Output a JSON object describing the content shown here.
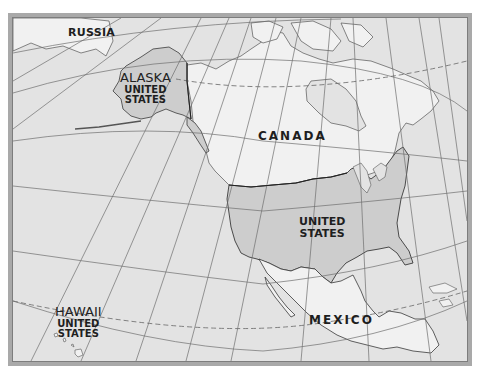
{
  "map": {
    "colors": {
      "frame": "#a9a9a9",
      "ocean": "#e3e3e3",
      "foreign_land": "#f1f1f1",
      "us_land": "#cdcdcd",
      "grid": "#6e6e6e",
      "border": "#3a3a3a"
    },
    "labels": {
      "russia": "RUSSIA",
      "alaska": {
        "name": "ALASKA",
        "country_line1": "UNITED",
        "country_line2": "STATES"
      },
      "canada": "CANADA",
      "united_states": {
        "line1": "UNITED",
        "line2": "STATES"
      },
      "hawaii": {
        "name": "HAWAII",
        "country_line1": "UNITED",
        "country_line2": "STATES"
      },
      "mexico": "MEXICO"
    }
  }
}
